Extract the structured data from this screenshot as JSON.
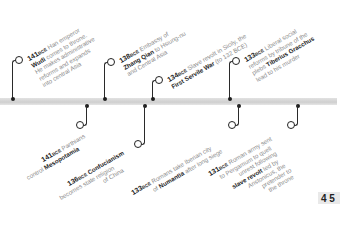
{
  "timeline": {
    "colors": {
      "bar": "#d6d6d6",
      "stem": "#2a2a2a",
      "text": "#8a8a8a",
      "emphasis": "#1e1e1e"
    },
    "events_above": [
      {
        "year": "141",
        "era": "BCE",
        "lines": [
          "Han emperor",
          "Wudi comes to throne.",
          "He makes administrative",
          "reforms and expands",
          "into central Asia"
        ],
        "emphasis": "Wudi"
      },
      {
        "year": "138",
        "era": "BCE",
        "lines": [
          "Embassy of",
          "Zhang Qian to Hsiung-nu",
          "and Central Asia"
        ],
        "emphasis": "Zhang Qian"
      },
      {
        "year": "134",
        "era": "BCE",
        "lines": [
          "Slave revolt in Sicily, the",
          "First Servile War (to 132 BCE)"
        ],
        "emphasis": "First Servile War"
      },
      {
        "year": "133",
        "era": "BCE",
        "lines": [
          "Liberal social",
          "reforms by tribune of the",
          "plebs Tiberius Gracchus",
          "lead to his murder"
        ],
        "emphasis": "Tiberius Gracchus"
      }
    ],
    "events_below": [
      {
        "year": "141",
        "era": "BCE",
        "lines": [
          "Parthians",
          "control Mesopotamia"
        ],
        "emphasis": "Mesopotamia"
      },
      {
        "year": "136",
        "era": "BCE",
        "lines": [
          "Confucianism",
          "becomes state religion",
          "of China"
        ],
        "emphasis": "Confucianism"
      },
      {
        "year": "133",
        "era": "BCE",
        "lines": [
          "Romans take Iberian city",
          "of Numantia after long siege"
        ],
        "emphasis": "Numantia"
      },
      {
        "year": "131",
        "era": "BCE",
        "lines": [
          "Roman army sent",
          "to Pergamum to quell",
          "unrest following",
          "slave revolt led by",
          "Aristonicus, the",
          "pretender to",
          "the throne"
        ],
        "emphasis": "slave revolt"
      }
    ],
    "texts": {
      "a0_l0": " Han emperor",
      "a0_l1b": "Wudi",
      "a0_l1": " comes to throne.",
      "a0_l2": "He makes administrative",
      "a0_l3": "reforms and expands",
      "a0_l4": "into central Asia",
      "a1_l0": " Embassy of",
      "a1_l1b": "Zhang Qian",
      "a1_l1": " to Hsiung-nu",
      "a1_l2": "and Central Asia",
      "a2_l0": " Slave revolt in Sicily, the",
      "a2_l1b": "First Servile War",
      "a2_l1": " (to 132 BCE)",
      "a3_l0": " Liberal social",
      "a3_l1": "reforms by tribune of the",
      "a3_l2": "plebs ",
      "a3_l2b": "Tiberius Gracchus",
      "a3_l3": "lead to his murder",
      "b0_l0": " Parthians",
      "b0_l1": "control ",
      "b0_l1b": "Mesopotamia",
      "b1_l0b": " Confucianism",
      "b1_l1": "becomes state religion",
      "b1_l2": "of China",
      "b2_l0": " Romans take Iberian city",
      "b2_l1": "of ",
      "b2_l1b": "Numantia",
      "b2_l1c": " after long siege",
      "b3_l0": " Roman army sent",
      "b3_l1": "to Pergamum to quell",
      "b3_l2": "unrest following",
      "b3_l3b": "slave revolt",
      "b3_l3": " led by",
      "b3_l4": "Aristonicus, the",
      "b3_l5": "pretender to",
      "b3_l6": "the throne",
      "y141": "141",
      "y138": "138",
      "y134": "134",
      "y133": "133",
      "y136": "136",
      "y131": "131",
      "bce": "BCE"
    },
    "page_corner": "4 5"
  }
}
